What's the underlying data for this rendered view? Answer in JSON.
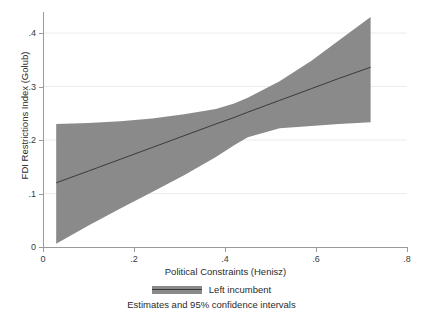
{
  "chart_data": {
    "type": "area",
    "title": "",
    "subtitle": "",
    "xlabel": "Political Constraints (Henisz)",
    "ylabel": "FDI Restrictions Index (Golub)",
    "xlim": [
      0,
      0.8
    ],
    "ylim": [
      0,
      0.44
    ],
    "xticks": [
      0,
      0.2,
      0.4,
      0.6,
      0.8
    ],
    "xticklabels": [
      "0",
      ".2",
      ".4",
      ".6",
      ".8"
    ],
    "yticks": [
      0,
      0.1,
      0.2,
      0.3,
      0.4
    ],
    "yticklabels": [
      "0",
      ".1",
      ".2",
      ".3",
      ".4"
    ],
    "grid": "horizontal",
    "legend_position": "below",
    "legend": [
      {
        "label": "Left incumbent",
        "band_color": "#8a8a8a",
        "line_color": "#3a3a3a"
      }
    ],
    "annotation": "Estimates and 95% confidence intervals",
    "series": [
      {
        "name": "Left incumbent",
        "kind": "fit-line-with-ci",
        "x": [
          0.029,
          0.1,
          0.17,
          0.24,
          0.31,
          0.38,
          0.42,
          0.45,
          0.52,
          0.59,
          0.65,
          0.72
        ],
        "estimate": [
          0.12,
          0.142,
          0.164,
          0.186,
          0.208,
          0.23,
          0.242,
          0.252,
          0.274,
          0.296,
          0.315,
          0.336
        ],
        "ci_upper": [
          0.23,
          0.232,
          0.235,
          0.24,
          0.248,
          0.258,
          0.268,
          0.279,
          0.31,
          0.348,
          0.386,
          0.43
        ],
        "ci_lower": [
          0.006,
          0.04,
          0.072,
          0.103,
          0.134,
          0.168,
          0.19,
          0.205,
          0.222,
          0.226,
          0.23,
          0.233
        ]
      }
    ]
  },
  "axes": {
    "y_title": "FDI Restrictions Index (Golub)",
    "x_title": "Political Constraints (Henisz)"
  },
  "legend": {
    "entry_label": "Left incumbent"
  },
  "footnote": {
    "text": "Estimates and 95% confidence intervals"
  }
}
